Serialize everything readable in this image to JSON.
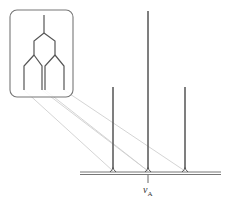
{
  "diagram": {
    "type": "nmr-splitting-tree",
    "inset": {
      "description": "Splitting tree (doublet of doublets collapsing to triplet)",
      "box": {
        "x": 10,
        "y": 10,
        "width": 63,
        "height": 87,
        "radius": 7
      }
    },
    "spectrum": {
      "baseline_y": 173,
      "baseline_x_start": 80,
      "baseline_x_end": 221,
      "peaks": [
        {
          "name": "left",
          "x": 113,
          "top_y": 87,
          "relative_intensity": 1
        },
        {
          "name": "center",
          "x": 148,
          "top_y": 11,
          "relative_intensity": 2
        },
        {
          "name": "right",
          "x": 185,
          "top_y": 87,
          "relative_intensity": 1
        }
      ],
      "center_label": {
        "symbol": "ν",
        "subscript": "A"
      }
    },
    "colors": {
      "line": "#555555",
      "connector": "#c8c8c8",
      "box_stroke": "#777777"
    }
  }
}
